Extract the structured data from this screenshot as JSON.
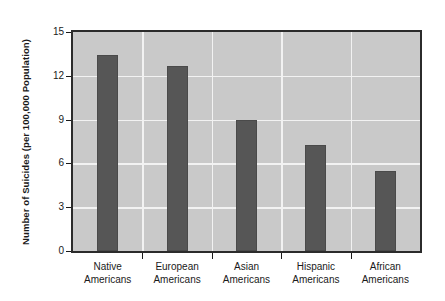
{
  "chart_data": {
    "type": "bar",
    "title": "",
    "xlabel": "",
    "ylabel": "Number of Suicides (per 100,000 Population)",
    "categories": [
      "Native Americans",
      "European Americans",
      "Asian Americans",
      "Hispanic Americans",
      "African Americans"
    ],
    "category_lines": [
      [
        "Native",
        "Americans"
      ],
      [
        "European",
        "Americans"
      ],
      [
        "Asian",
        "Americans"
      ],
      [
        "Hispanic",
        "Americans"
      ],
      [
        "African",
        "Americans"
      ]
    ],
    "values": [
      13.4,
      12.7,
      9.0,
      7.25,
      5.5
    ],
    "ylim": [
      0,
      15
    ],
    "ytick_values": [
      0,
      3,
      6,
      9,
      12,
      15
    ],
    "ytick_labels": [
      "0",
      "3",
      "6",
      "9",
      "12",
      "15"
    ],
    "grid": true,
    "grid_color": "#f2f2f2",
    "legend": null,
    "bar_color": "#565656",
    "plot_background": "#c9c9c9",
    "axis_color": "#2b2b2b",
    "text_color": "#1a1a1a"
  }
}
